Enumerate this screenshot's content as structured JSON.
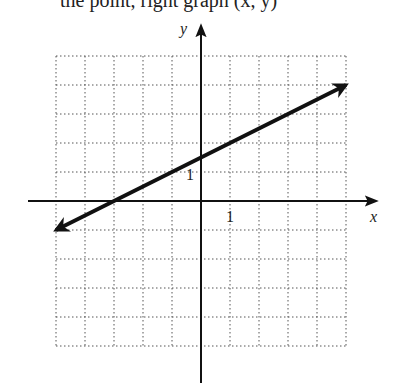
{
  "header": {
    "cut_text": "the point, right graph (x, y)"
  },
  "chart_data": {
    "type": "line",
    "title": "",
    "xlabel": "x",
    "ylabel": "y",
    "xlim": [
      -5,
      5
    ],
    "ylim": [
      -5,
      5
    ],
    "grid": true,
    "tick_labels": {
      "x": "1",
      "y": "1"
    },
    "series": [
      {
        "name": "line",
        "equation": "y = 0.5x + 1.5",
        "x": [
          -5,
          5
        ],
        "y": [
          -1,
          4
        ],
        "arrows": "both"
      }
    ],
    "intercepts": {
      "x_intercept": -3,
      "y_intercept": 1.5
    }
  },
  "labels": {
    "x_axis": "x",
    "y_axis": "y",
    "x_tick": "1",
    "y_tick": "1"
  }
}
